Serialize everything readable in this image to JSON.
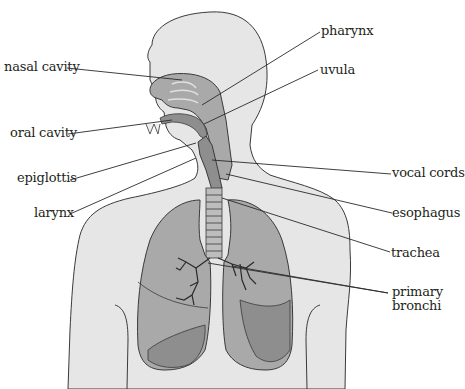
{
  "diagram": {
    "colors": {
      "body_fill": "#e6e6e6",
      "organ_fill": "#a9a9a9",
      "organ_dark": "#8e8e8e",
      "outline": "#3a3a3a",
      "leader_line": "#2a2a2a",
      "text": "#231f20"
    },
    "labels_left": [
      {
        "id": "nasal-cavity",
        "text": "nasal cavity"
      },
      {
        "id": "oral-cavity",
        "text": "oral cavity"
      },
      {
        "id": "epiglottis",
        "text": "epiglottis"
      },
      {
        "id": "larynx",
        "text": "larynx"
      }
    ],
    "labels_right": [
      {
        "id": "pharynx",
        "text": "pharynx"
      },
      {
        "id": "uvula",
        "text": "uvula"
      },
      {
        "id": "vocal-cords",
        "text": "vocal cords"
      },
      {
        "id": "esophagus",
        "text": "esophagus"
      },
      {
        "id": "trachea",
        "text": "trachea"
      },
      {
        "id": "primary-bronchi",
        "text": "primary\nbronchi",
        "line1": "primary",
        "line2": "bronchi"
      }
    ]
  }
}
